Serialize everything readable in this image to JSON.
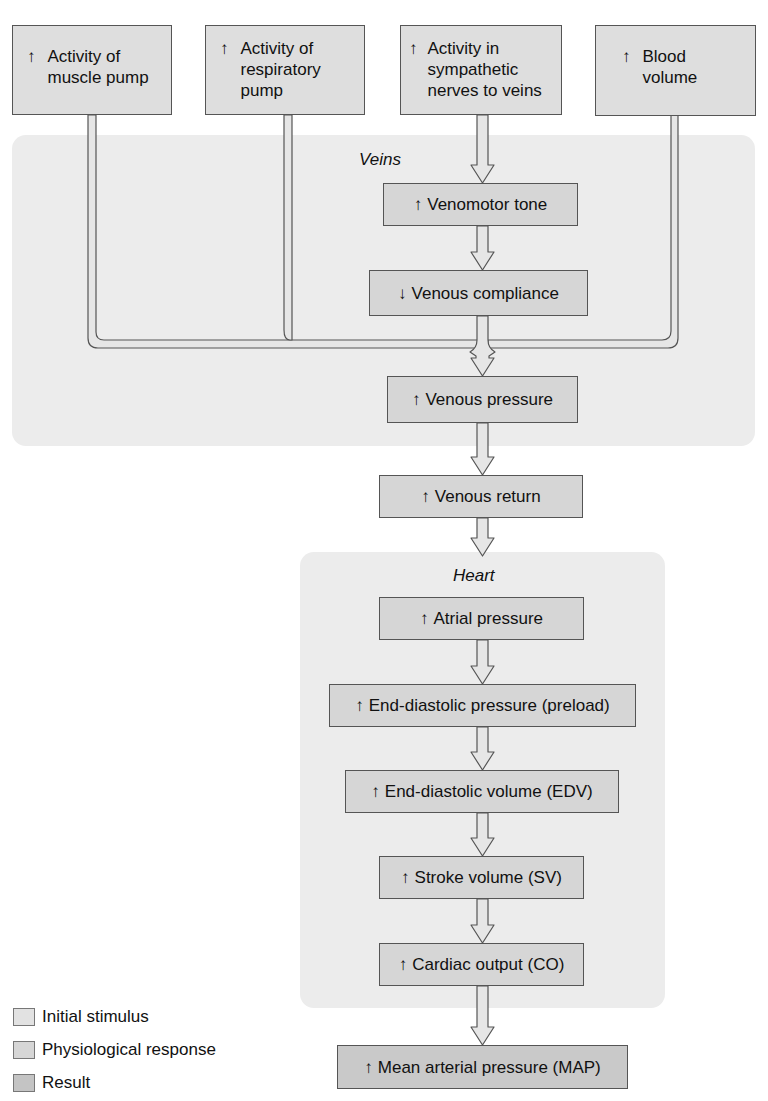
{
  "colors": {
    "region_bg": "#ececec",
    "stimulus_fill": "#dedede",
    "response_fill": "#d6d6d6",
    "result_fill": "#c9c9c9",
    "border": "#555555",
    "pipe_fill": "#e6e6e6"
  },
  "regions": {
    "veins": {
      "label": "Veins"
    },
    "heart": {
      "label": "Heart"
    }
  },
  "stimuli": [
    {
      "arrow": "↑",
      "direction": "increase",
      "label": "Activity of\nmuscle pump"
    },
    {
      "arrow": "↑",
      "direction": "increase",
      "label": "Activity of\nrespiratory\npump"
    },
    {
      "arrow": "↑",
      "direction": "increase",
      "label": "Activity in\nsympathetic\nnerves to veins"
    },
    {
      "arrow": "↑",
      "direction": "increase",
      "label": "Blood\nvolume"
    }
  ],
  "steps": [
    {
      "arrow": "↑",
      "direction": "increase",
      "label": "Venomotor tone",
      "type": "response",
      "region": "veins"
    },
    {
      "arrow": "↓",
      "direction": "decrease",
      "label": "Venous compliance",
      "type": "response",
      "region": "veins"
    },
    {
      "arrow": "↑",
      "direction": "increase",
      "label": "Venous pressure",
      "type": "response",
      "region": "veins"
    },
    {
      "arrow": "↑",
      "direction": "increase",
      "label": "Venous return",
      "type": "response",
      "region": ""
    },
    {
      "arrow": "↑",
      "direction": "increase",
      "label": "Atrial pressure",
      "type": "response",
      "region": "heart"
    },
    {
      "arrow": "↑",
      "direction": "increase",
      "label": "End-diastolic pressure (preload)",
      "type": "response",
      "region": "heart"
    },
    {
      "arrow": "↑",
      "direction": "increase",
      "label": "End-diastolic volume (EDV)",
      "type": "response",
      "region": "heart"
    },
    {
      "arrow": "↑",
      "direction": "increase",
      "label": "Stroke volume (SV)",
      "type": "response",
      "region": "heart"
    },
    {
      "arrow": "↑",
      "direction": "increase",
      "label": "Cardiac output (CO)",
      "type": "response",
      "region": "heart"
    },
    {
      "arrow": "↑",
      "direction": "increase",
      "label": "Mean arterial pressure (MAP)",
      "type": "result",
      "region": ""
    }
  ],
  "legend": [
    {
      "label": "Initial stimulus",
      "swatch": "#dedede"
    },
    {
      "label": "Physiological response",
      "swatch": "#d6d6d6"
    },
    {
      "label": "Result",
      "swatch": "#c9c9c9"
    }
  ]
}
